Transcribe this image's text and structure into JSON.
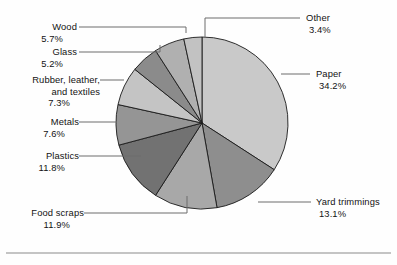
{
  "chart_data": {
    "type": "pie",
    "title": "",
    "subtitle": "",
    "xlabel": "",
    "ylabel": "",
    "legend_position": "callout-labels",
    "grid": false,
    "start_angle_deg": 0,
    "direction": "clockwise",
    "units": "percent",
    "categories": [
      "Paper",
      "Yard trimmings",
      "Food scraps",
      "Plastics",
      "Metals",
      "Rubber, leather, and textiles",
      "Glass",
      "Wood",
      "Other"
    ],
    "values": [
      34.2,
      13.1,
      11.9,
      11.8,
      7.6,
      7.3,
      5.2,
      5.7,
      3.4
    ],
    "slices": [
      {
        "label": "Paper",
        "label_line1": "Paper",
        "label_line2": "",
        "value": 34.2,
        "value_text": "34.2%",
        "color": "#c9c9c9",
        "side": "right"
      },
      {
        "label": "Yard trimmings",
        "label_line1": "Yard trimmings",
        "label_line2": "",
        "value": 13.1,
        "value_text": "13.1%",
        "color": "#8e8e8e",
        "side": "right"
      },
      {
        "label": "Food scraps",
        "label_line1": "Food scraps",
        "label_line2": "",
        "value": 11.9,
        "value_text": "11.9%",
        "color": "#a8a8a8",
        "side": "left"
      },
      {
        "label": "Plastics",
        "label_line1": "Plastics",
        "label_line2": "",
        "value": 11.8,
        "value_text": "11.8%",
        "color": "#727272",
        "side": "left"
      },
      {
        "label": "Metals",
        "label_line1": "Metals",
        "label_line2": "",
        "value": 7.6,
        "value_text": "7.6%",
        "color": "#959595",
        "side": "left"
      },
      {
        "label": "Rubber, leather, and textiles",
        "label_line1": "Rubber, leather,",
        "label_line2": "and textiles",
        "value": 7.3,
        "value_text": "7.3%",
        "color": "#c4c4c4",
        "side": "left"
      },
      {
        "label": "Glass",
        "label_line1": "Glass",
        "label_line2": "",
        "value": 5.2,
        "value_text": "5.2%",
        "color": "#8b8b8b",
        "side": "left"
      },
      {
        "label": "Wood",
        "label_line1": "Wood",
        "label_line2": "",
        "value": 5.7,
        "value_text": "5.7%",
        "color": "#b0b0b0",
        "side": "left"
      },
      {
        "label": "Other",
        "label_line1": "Other",
        "label_line2": "",
        "value": 3.4,
        "value_text": "3.4%",
        "color": "#c2c2c2",
        "side": "right"
      }
    ],
    "colors": {
      "background": "#fefefe",
      "slice_outline": "#1a1a1a",
      "leader_line": "#6d6d6d",
      "text": "#131313",
      "footer_rule": "#8a8a8a"
    }
  }
}
